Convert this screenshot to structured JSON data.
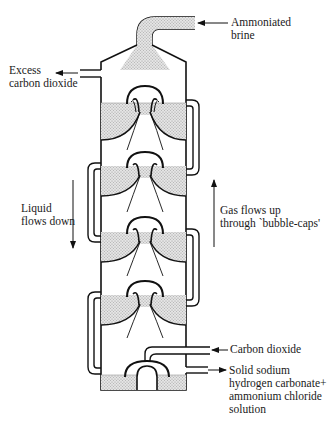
{
  "diagram": {
    "labels": {
      "ammoniated_brine": "Ammoniated\nbrine",
      "excess_co2": "Excess\ncarbon dioxide",
      "liquid_flows": "Liquid\nflows down",
      "gas_flows": "Gas flows up\nthrough `bubble-caps'",
      "carbon_dioxide": "Carbon dioxide",
      "product": "Solid sodium\nhydrogen carbonate+\nammonium chloride\nsolution"
    },
    "trays": [
      {
        "index": 1,
        "liquid_y": 103,
        "cap_top_y": 86
      },
      {
        "index": 2,
        "liquid_y": 166,
        "cap_top_y": 152
      },
      {
        "index": 3,
        "liquid_y": 232,
        "cap_top_y": 217
      },
      {
        "index": 4,
        "liquid_y": 295,
        "cap_top_y": 281
      }
    ],
    "colors": {
      "line": "#111111",
      "liquid_fill": "#d6d6d6",
      "background": "#ffffff"
    }
  }
}
